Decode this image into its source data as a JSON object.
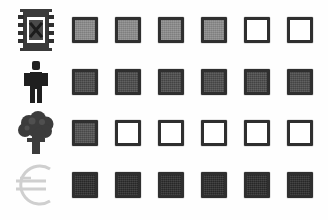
{
  "board": {
    "columns": 6,
    "rows": 4,
    "background_color": "#fefefe",
    "cell_border_color": "#2f2f2f",
    "cell_empty_color": "#ffffff"
  },
  "rows": [
    {
      "id": "row-film",
      "icon": "film-strip-icon",
      "label": "Film strip",
      "fill_color": "#8a8a8a",
      "filled_count": 4,
      "cells": [
        {
          "state": "filled",
          "label": "Filled"
        },
        {
          "state": "filled",
          "label": "Filled"
        },
        {
          "state": "filled",
          "label": "Filled"
        },
        {
          "state": "filled",
          "label": "Filled"
        },
        {
          "state": "empty",
          "label": "Empty"
        },
        {
          "state": "empty",
          "label": "Empty"
        }
      ]
    },
    {
      "id": "row-person",
      "icon": "person-icon",
      "label": "Person",
      "fill_color": "#4a4a4a",
      "filled_count": 6,
      "cells": [
        {
          "state": "filled",
          "label": "Filled"
        },
        {
          "state": "filled",
          "label": "Filled"
        },
        {
          "state": "filled",
          "label": "Filled"
        },
        {
          "state": "filled",
          "label": "Filled"
        },
        {
          "state": "filled",
          "label": "Filled"
        },
        {
          "state": "filled",
          "label": "Filled"
        }
      ]
    },
    {
      "id": "row-tree",
      "icon": "tree-icon",
      "label": "Tree",
      "fill_color": "#4f4f4f",
      "filled_count": 1,
      "cells": [
        {
          "state": "filled",
          "label": "Filled"
        },
        {
          "state": "empty",
          "label": "Empty"
        },
        {
          "state": "empty",
          "label": "Empty"
        },
        {
          "state": "empty",
          "label": "Empty"
        },
        {
          "state": "empty",
          "label": "Empty"
        },
        {
          "state": "empty",
          "label": "Empty"
        }
      ]
    },
    {
      "id": "row-euro",
      "icon": "euro-currency-icon",
      "label": "Euro",
      "fill_color": "#2b2b2b",
      "filled_count": 6,
      "cells": [
        {
          "state": "filled",
          "label": "Filled"
        },
        {
          "state": "filled",
          "label": "Filled"
        },
        {
          "state": "filled",
          "label": "Filled"
        },
        {
          "state": "filled",
          "label": "Filled"
        },
        {
          "state": "filled",
          "label": "Filled"
        },
        {
          "state": "filled",
          "label": "Filled"
        }
      ]
    }
  ]
}
